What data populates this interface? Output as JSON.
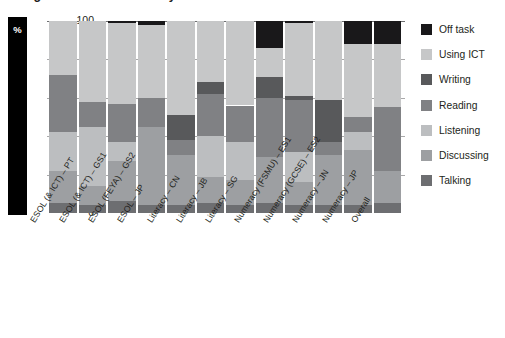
{
  "title": "Figure 4: Learner activity",
  "axis": {
    "y_unit": "%",
    "yticks": [
      "0",
      "20",
      "40",
      "60",
      "80",
      "100"
    ],
    "ylim": [
      0,
      100
    ]
  },
  "legend": {
    "position": "right",
    "entries": [
      {
        "label": "Off task",
        "color": "#19181a"
      },
      {
        "label": "Using ICT",
        "color": "#c6c7c8"
      },
      {
        "label": "Writing",
        "color": "#58595b"
      },
      {
        "label": "Reading",
        "color": "#808184"
      },
      {
        "label": "Listening",
        "color": "#bcbec0"
      },
      {
        "label": "Discussing",
        "color": "#9d9fa2"
      },
      {
        "label": "Talking",
        "color": "#6d6e71"
      }
    ]
  },
  "chart_data": {
    "type": "bar",
    "stacked": true,
    "title": "Figure 4: Learner activity",
    "xlabel": "",
    "ylabel": "%",
    "ylim": [
      0,
      100
    ],
    "grid": true,
    "categories": [
      "ESOL (& ICT) – PT",
      "ESOL (& ICT) – GS1",
      "ESOL (FEYA) – GS2",
      "ESOL – JP",
      "Literacy – CN",
      "Literacy – JB",
      "Literacy – SG",
      "Numeracy (FSMU) – ES1",
      "Numeracy (GCSE) – ES2",
      "Numeracy – JN",
      "Numeracy – JP",
      "Overall"
    ],
    "series": [
      {
        "name": "Talking",
        "color": "#6d6e71",
        "values": [
          5,
          4,
          6,
          4,
          4,
          5,
          4,
          5,
          4,
          4,
          4,
          5
        ]
      },
      {
        "name": "Discussing",
        "color": "#9d9fa2",
        "values": [
          17,
          10,
          21,
          41,
          26,
          14,
          13,
          24,
          12,
          26,
          29,
          17
        ]
      },
      {
        "name": "Listening",
        "color": "#bcbec0",
        "values": [
          20,
          31,
          10,
          0,
          0,
          21,
          20,
          0,
          16,
          0,
          9,
          0
        ]
      },
      {
        "name": "Reading",
        "color": "#808184",
        "values": [
          30,
          13,
          20,
          15,
          8,
          22,
          19,
          31,
          27,
          7,
          8,
          33
        ]
      },
      {
        "name": "Writing",
        "color": "#58595b",
        "values": [
          0,
          0,
          0,
          0,
          13,
          6,
          0,
          11,
          2,
          22,
          0,
          0
        ]
      },
      {
        "name": "Using ICT",
        "color": "#c6c7c8",
        "values": [
          28,
          42,
          42,
          38,
          49,
          32,
          44,
          15,
          38,
          41,
          38,
          33
        ]
      },
      {
        "name": "Off task",
        "color": "#19181a",
        "values": [
          0,
          0,
          1,
          2,
          0,
          0,
          0,
          14,
          1,
          0,
          12,
          12
        ]
      }
    ]
  },
  "layout": {
    "bar_positions_px": [
      2,
      31.5,
      61,
      90.5,
      120,
      149.5,
      179,
      208.5,
      238,
      267.5,
      297,
      326.5
    ],
    "bar_width_px": 27.5,
    "label_x_px": [
      28,
      57,
      86,
      115,
      145,
      174,
      203,
      232,
      261,
      290,
      320,
      349
    ]
  }
}
